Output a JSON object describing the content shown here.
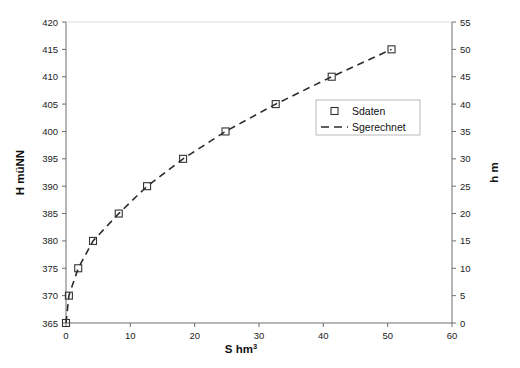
{
  "chart_data": {
    "type": "line",
    "title": "",
    "xlabel": "S hm3",
    "xlabel_base": "S  hm",
    "xlabel_sup": "3",
    "ylabel_left": "H müNN",
    "ylabel_right": "h  m",
    "xlim": [
      0,
      60
    ],
    "xticks": [
      0,
      10,
      20,
      30,
      40,
      50,
      60
    ],
    "xtick_labels": [
      "0",
      "10",
      "20",
      "30",
      "40",
      "50",
      "60"
    ],
    "ylim_left": [
      365,
      420
    ],
    "yticks_left": [
      365,
      370,
      375,
      380,
      385,
      390,
      395,
      400,
      405,
      410,
      415,
      420
    ],
    "ytick_labels_left": [
      "365",
      "370",
      "375",
      "380",
      "385",
      "390",
      "395",
      "400",
      "405",
      "410",
      "415",
      "420"
    ],
    "ylim_right": [
      0,
      55
    ],
    "yticks_right": [
      0,
      5,
      10,
      15,
      20,
      25,
      30,
      35,
      40,
      45,
      50,
      55
    ],
    "ytick_labels_right": [
      "0",
      "5",
      "10",
      "15",
      "20",
      "25",
      "30",
      "35",
      "40",
      "45",
      "50",
      "55"
    ],
    "grid": false,
    "legend_position": "center-right",
    "series": [
      {
        "name": "Sdaten",
        "style": "markers",
        "marker": "open-square",
        "color": "#333333",
        "points": [
          {
            "x": 0.0,
            "y": 365.0
          },
          {
            "x": 0.45,
            "y": 370.0
          },
          {
            "x": 1.9,
            "y": 375.0
          },
          {
            "x": 4.2,
            "y": 380.0
          },
          {
            "x": 8.2,
            "y": 385.0
          },
          {
            "x": 12.6,
            "y": 390.0
          },
          {
            "x": 18.2,
            "y": 395.0
          },
          {
            "x": 24.8,
            "y": 400.0
          },
          {
            "x": 32.6,
            "y": 405.0
          },
          {
            "x": 41.3,
            "y": 410.0
          },
          {
            "x": 50.6,
            "y": 415.0
          }
        ]
      },
      {
        "name": "Sgerechnet",
        "style": "dashed-line",
        "color": "#2b2b2b",
        "points": [
          {
            "x": 0.0,
            "y": 365.0
          },
          {
            "x": 0.45,
            "y": 370.0
          },
          {
            "x": 1.9,
            "y": 375.0
          },
          {
            "x": 4.2,
            "y": 380.0
          },
          {
            "x": 8.2,
            "y": 385.0
          },
          {
            "x": 12.6,
            "y": 390.0
          },
          {
            "x": 18.2,
            "y": 395.0
          },
          {
            "x": 24.8,
            "y": 400.0
          },
          {
            "x": 32.6,
            "y": 405.0
          },
          {
            "x": 41.3,
            "y": 410.0
          },
          {
            "x": 50.6,
            "y": 415.0
          }
        ]
      }
    ],
    "legend": [
      {
        "label": "Sdaten",
        "marker": "open-square"
      },
      {
        "label": "Sgerechnet",
        "marker": "dashed-line"
      }
    ],
    "colors": {
      "axis": "#6f6f6f",
      "marker": "#333333",
      "line": "#2b2b2b",
      "text": "#1a1a1a",
      "background": "#ffffff",
      "legend_border": "#b9b9b9"
    }
  }
}
